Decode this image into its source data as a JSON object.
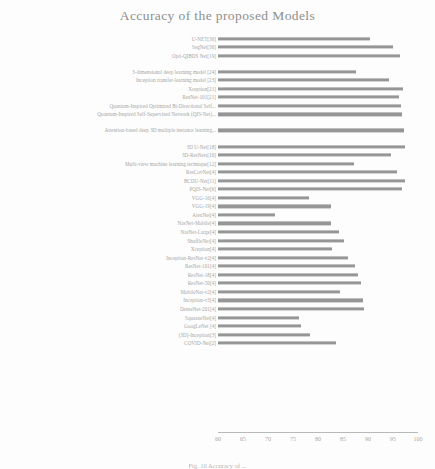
{
  "chart_data": {
    "type": "bar",
    "orientation": "horizontal",
    "title": "Accuracy of the proposed Models",
    "xlabel": "",
    "ylabel": "",
    "xlim": [
      60,
      100
    ],
    "xticks": [
      60,
      65,
      70,
      75,
      80,
      85,
      90,
      95,
      100
    ],
    "grid": false,
    "legend": null,
    "bar_color": "#8d8d8d",
    "categories": [
      "U-NET[36]",
      "SegNet[36]",
      "Opti-QIBDS Net[19]",
      "3-dimensional deep learning model [24]",
      "Inception transfer-learning model [23]",
      "Xception[21]",
      "ResNet-101[21]",
      "Quantum-Inspired Optimized Bi-Directional Self...",
      "Quantum-Inspired Self-Supervised Network (QIS-Net)...",
      "Attention-based deep 3D multiple instance learning...",
      "3D U-Net[18]",
      "3D-ResNets[16]",
      "Multi-view machine learning technique[12]",
      "ResCovNet[4]",
      "BCDU-Net[11]",
      "PQIS-Net[6]",
      "VGG-16[4]",
      "VGG-19[4]",
      "AlexNet[4]",
      "NasNet-Mobile[4]",
      "NasNet-Large[4]",
      "ShuffleNet[4]",
      "Xception[4]",
      "Inception-ResNet-v2[4]",
      "ResNet-101[4]",
      "ResNet-18[4]",
      "ResNet-50[4]",
      "MobileNet-v2[4]",
      "Inception-v3[4]",
      "DenseNet-201[4]",
      "SqueezeNet[4]",
      "GoogLeNet [4]",
      "(3D)-Inception[3]",
      "COVID-Net[2]"
    ],
    "values": [
      90.3,
      95.0,
      96.4,
      87.5,
      94.2,
      96.9,
      96.1,
      96.5,
      96.8,
      97.2,
      97.4,
      94.5,
      87.1,
      95.7,
      97.3,
      96.8,
      78.1,
      82.5,
      71.4,
      82.6,
      84.2,
      85.2,
      82.7,
      85.9,
      87.4,
      88.0,
      88.6,
      84.3,
      88.9,
      89.2,
      76.2,
      76.6,
      78.4,
      83.5
    ],
    "group_gaps_after": [
      2,
      8,
      9
    ]
  },
  "caption": {
    "text": "Fig. 10 Accuracy of ..."
  }
}
